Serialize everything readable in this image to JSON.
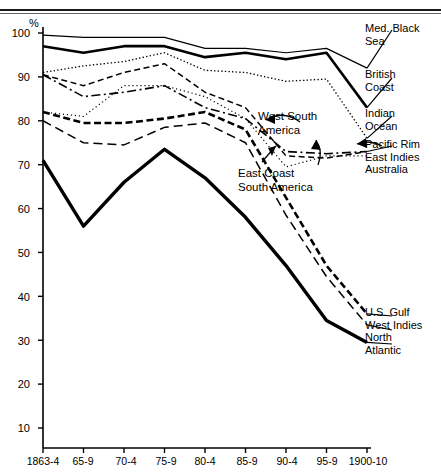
{
  "axis": {
    "y_unit_label": "%",
    "y_ticks": [
      "100",
      "90",
      "80",
      "70",
      "60",
      "50",
      "40",
      "30",
      "20",
      "10"
    ],
    "x_ticks": [
      "1863-4",
      "65-9",
      "70-4",
      "75-9",
      "80-4",
      "85-9",
      "90-4",
      "95-9",
      "1900-10"
    ]
  },
  "legend": {
    "med_black_sea": "Med. Black\nSea",
    "british_coast": "British\nCoast",
    "indian_ocean": "Indian\nOcean",
    "pacific_rim": "Pacific Rim\nEast Indies\nAustralia",
    "us_gulf": "U.S. Gulf\nWest Indies\nNorth\nAtlantic"
  },
  "annotations": {
    "west_south_america": "West South\nAmerica",
    "east_coast_south_america": "East Coast\nSouth America"
  },
  "chart_data": {
    "type": "line",
    "title": "",
    "xlabel": "",
    "ylabel": "%",
    "ylim": [
      0,
      100
    ],
    "grid": false,
    "legend_position": "right",
    "categories": [
      "1863-4",
      "65-9",
      "70-4",
      "75-9",
      "80-4",
      "85-9",
      "90-4",
      "95-9",
      "1900-10"
    ],
    "series": [
      {
        "name": "Med. Black Sea",
        "style": "thin-solid",
        "values": [
          99.5,
          99.0,
          99.0,
          99.0,
          96.5,
          96.5,
          95.5,
          96.5,
          92.0
        ]
      },
      {
        "name": "British Coast",
        "style": "thick-solid",
        "values": [
          97.0,
          95.5,
          97.0,
          97.0,
          94.5,
          95.5,
          94.0,
          95.5,
          83.0
        ]
      },
      {
        "name": "Indian Ocean",
        "style": "fine-dotted",
        "values": [
          91.0,
          92.5,
          93.5,
          95.5,
          91.5,
          91.0,
          89.0,
          89.5,
          76.0
        ]
      },
      {
        "name": "West South America",
        "style": "dashed-medium",
        "values": [
          90.5,
          88.0,
          91.0,
          93.0,
          86.5,
          83.0,
          72.0,
          71.5,
          73.0
        ]
      },
      {
        "name": "Pacific Rim East Indies Australia",
        "style": "dash-dot",
        "values": [
          90.5,
          85.5,
          86.5,
          88.0,
          83.0,
          80.5,
          73.0,
          72.5,
          73.0
        ]
      },
      {
        "name": "East Coast South America",
        "style": "dotted-coarse",
        "values": [
          82.0,
          81.0,
          88.0,
          88.0,
          85.5,
          80.5,
          69.5,
          72.0,
          72.0
        ]
      },
      {
        "name": "U.S. Gulf",
        "style": "thick-dashed",
        "values": [
          82.0,
          79.5,
          79.5,
          80.5,
          82.0,
          78.0,
          62.5,
          47.0,
          36.0
        ]
      },
      {
        "name": "West Indies",
        "style": "long-dashed",
        "values": [
          80.0,
          75.0,
          74.5,
          78.5,
          79.5,
          75.0,
          58.5,
          44.5,
          33.5
        ]
      },
      {
        "name": "North Atlantic",
        "style": "heavy-solid",
        "values": [
          71.0,
          56.0,
          66.0,
          73.5,
          67.0,
          58.0,
          47.0,
          34.5,
          29.5
        ]
      }
    ]
  }
}
